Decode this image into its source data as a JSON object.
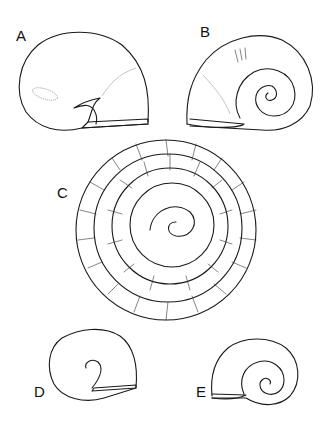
{
  "figure": {
    "panels": [
      {
        "label": "A",
        "view": "apertural view"
      },
      {
        "label": "B",
        "view": "umbilical view"
      },
      {
        "label": "C",
        "view": "operculum / spiral detail"
      },
      {
        "label": "D",
        "view": "apertural view (small)"
      },
      {
        "label": "E",
        "view": "umbilical view (small)"
      }
    ]
  }
}
